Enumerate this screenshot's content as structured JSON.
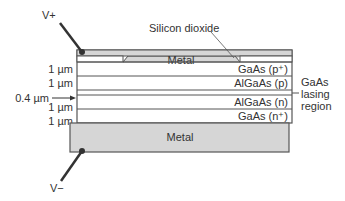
{
  "diagram": {
    "terminals": {
      "positive": "V+",
      "negative": "V−"
    },
    "top_layer": {
      "metal_label": "Metal",
      "oxide_label": "Silicon dioxide"
    },
    "layers": [
      {
        "thickness": "1 µm",
        "material": "GaAs (p⁺)"
      },
      {
        "thickness": "1 µm",
        "material": "AlGaAs (p)"
      },
      {
        "thickness": "0.4 µm",
        "material": ""
      },
      {
        "thickness": "1 µm",
        "material": "AlGaAs (n)"
      },
      {
        "thickness": "1 µm",
        "material": "GaAs (n⁺)"
      }
    ],
    "bottom_metal_label": "Metal",
    "lasing_region_label": [
      "GaAs",
      "lasing",
      "region"
    ],
    "colors": {
      "metal": "#d6d6d6",
      "outline": "#555555",
      "wire": "#333333"
    }
  }
}
